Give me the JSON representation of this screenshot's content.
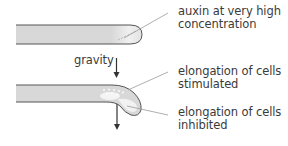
{
  "diagram": {
    "type": "plant-root-gravitropism",
    "colors": {
      "root_fill": "#d6d6d6",
      "root_stroke": "#555555",
      "highlight": "#f2f2f2",
      "leader_line": "#9a9a9a",
      "arrow": "#333333",
      "text": "#3a3a3a"
    },
    "labels": {
      "auxin_line1": "auxin at very high",
      "auxin_line2": "concentration",
      "gravity": "gravity",
      "stimulated_line1": "elongation of cells",
      "stimulated_line2": "stimulated",
      "inhibited_line1": "elongation of cells",
      "inhibited_line2": "inhibited"
    }
  }
}
